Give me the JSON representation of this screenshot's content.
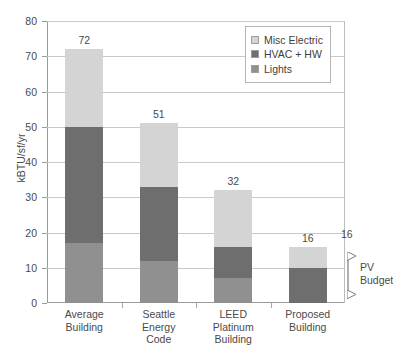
{
  "chart_data": {
    "type": "bar",
    "subtype": "stacked-vertical",
    "title": "",
    "xlabel": "",
    "ylabel": "kBTU/sf/yr",
    "ylim": [
      0,
      80
    ],
    "yticks": [
      0,
      10,
      20,
      30,
      40,
      50,
      60,
      70,
      80
    ],
    "grid": true,
    "legend_position": "top-right",
    "categories": [
      "Average Building",
      "Seattle Energy Code",
      "LEED Platinum Building",
      "Proposed Building"
    ],
    "category_lines": [
      [
        "Average",
        "Building"
      ],
      [
        "Seattle",
        "Energy",
        "Code"
      ],
      [
        "LEED",
        "Platinum",
        "Building"
      ],
      [
        "Proposed",
        "Building"
      ]
    ],
    "series": [
      {
        "name": "Lights",
        "color": "#909090",
        "values": [
          17,
          12,
          7,
          0
        ]
      },
      {
        "name": "HVAC + HW",
        "color": "#6e6e6e",
        "values": [
          33,
          21,
          9,
          10
        ]
      },
      {
        "name": "Misc Electric",
        "color": "#d4d4d4",
        "values": [
          22,
          18,
          16,
          6
        ]
      }
    ],
    "totals": [
      72,
      51,
      32,
      16
    ],
    "total_labels": [
      "72",
      "51",
      "32",
      "16"
    ],
    "annotations": [
      {
        "name": "pv-budget",
        "label_lines": [
          "PV",
          "Budget"
        ],
        "value_label": "16",
        "from": 0,
        "to": 16,
        "style": "double-headed-arrow"
      }
    ]
  },
  "legend": {
    "items": [
      {
        "label": "Misc Electric",
        "color": "#d4d4d4"
      },
      {
        "label": "HVAC + HW",
        "color": "#6e6e6e"
      },
      {
        "label": "Lights",
        "color": "#909090"
      }
    ]
  },
  "axis": {
    "y_title": "kBTU/sf/yr",
    "y_tick_labels": [
      "0",
      "10",
      "20",
      "30",
      "40",
      "50",
      "60",
      "70",
      "80"
    ]
  }
}
